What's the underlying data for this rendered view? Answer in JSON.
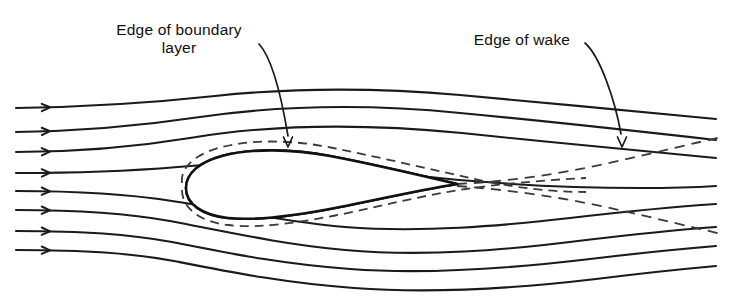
{
  "figure": {
    "name": "flow-past-streamlined-body",
    "background_color": "#ffffff",
    "ink_color": "#1a1a1a",
    "dashed_color": "#3a3a3a",
    "width": 730,
    "height": 296
  },
  "annotations": {
    "boundary_layer": {
      "line1": "Edge of boundary",
      "line2": "layer",
      "x": 179,
      "y1": 35,
      "y2": 53,
      "leader_path": "M 259 44 C 272 58, 282 100, 288 136",
      "arrow_tip_x": 288,
      "arrow_tip_y": 147
    },
    "wake": {
      "line1": "Edge of wake",
      "x": 522,
      "y1": 45,
      "leader_path": "M 585 43 C 600 56, 615 100, 621 134",
      "arrow_tip_x": 622,
      "arrow_tip_y": 147
    }
  },
  "streamlines": {
    "count": 8,
    "arrow_x": 50,
    "inlet_x": 16,
    "outlet_x": 716,
    "paths": [
      "M 16 108 C 90 107, 150 103, 215 96 C 300 87, 380 88, 460 95 C 540 102, 640 112, 716 119",
      "M 16 132 C 86 131, 140 126, 200 117 C 290 104, 380 105, 460 113 C 545 121, 645 132, 716 140",
      "M 16 152 C 84 152, 135 147, 190 138 C 285 122, 380 125, 462 133 C 548 142, 648 152, 716 158",
      "M 16 173 C 84 173, 130 171, 178 167 C 250 160, 330 166, 400 174 C 470 182, 560 188, 640 188 C 672 188, 700 187, 716 186",
      "M 16 191 C 82 191, 128 194, 172 201 C 230 210, 285 222, 345 227 C 420 233, 500 226, 570 218 C 630 211, 685 206, 716 204",
      "M 16 210 C 82 210, 126 213, 170 221 C 228 232, 280 244, 345 250 C 425 257, 505 250, 578 241 C 636 234, 688 229, 716 227",
      "M 16 231 C 84 231, 128 234, 172 242 C 228 253, 280 264, 350 269 C 430 275, 515 268, 590 259 C 648 252, 692 248, 716 246",
      "M 16 250 C 86 250, 130 253, 174 261 C 230 272, 284 283, 354 288 C 434 294, 520 288, 596 279 C 652 272, 694 268, 716 266"
    ]
  },
  "body": {
    "leading_edge_x": 186,
    "trailing_edge_x": 457,
    "trailing_edge_y": 184,
    "outline_path": "M 186 188 C 186 173, 200 162, 222 156 C 252 148, 292 149, 330 156 C 372 164, 415 174, 457 184 C 420 190, 380 199, 340 207 C 300 215, 258 221, 228 218 C 202 215, 186 204, 186 188 Z",
    "hatch_angle_deg": 60,
    "hatch_spacing_px": 5,
    "hatch_color": "#1a1a1a"
  },
  "boundary_layer_edge": {
    "upper_path": "M 182 183 C 180 166, 198 153, 222 147 C 254 139, 294 140, 333 148 C 378 157, 425 168, 470 178 C 505 186, 545 192, 586 192",
    "lower_path": "M 182 190 C 182 208, 200 222, 228 225 C 260 229, 302 222, 343 214 C 385 205, 425 195, 466 189 C 500 184, 545 180, 586 178"
  },
  "wake_edges": {
    "upper_path": "M 457 184 C 500 182, 545 176, 585 168 C 625 160, 665 150, 700 142 C 710 140, 716 138, 722 137",
    "lower_path": "M 457 186 C 500 189, 545 195, 586 203 C 626 211, 666 221, 700 229 C 710 231, 716 233, 722 234"
  }
}
